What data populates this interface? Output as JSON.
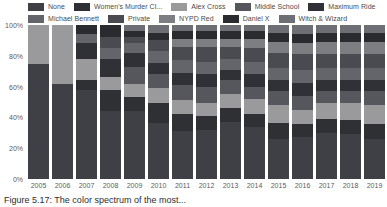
{
  "chart_data": {
    "type": "bar",
    "stacked": true,
    "normalized": true,
    "title": "",
    "subtitle": "",
    "xlabel": "",
    "ylabel": "",
    "ylim": [
      0,
      100
    ],
    "yticks": [
      "0%",
      "20%",
      "40%",
      "60%",
      "80%",
      "100%"
    ],
    "ytick_values": [
      0,
      20,
      40,
      60,
      80,
      100
    ],
    "grid": false,
    "legend_position": "top",
    "categories": [
      "2005",
      "2006",
      "2007",
      "2008",
      "2009",
      "2010",
      "2011",
      "2012",
      "2013",
      "2014",
      "2015",
      "2016",
      "2017",
      "2018",
      "2019"
    ],
    "series": [
      {
        "name": "None",
        "color": "#3f4045",
        "values": [
          75,
          62,
          58,
          44,
          44,
          36,
          31,
          32,
          37,
          34,
          26,
          27,
          30,
          29,
          26
        ]
      },
      {
        "name": "Women's Murder Cl...",
        "color": "#2f3034",
        "values": [
          0,
          0,
          6,
          14,
          9,
          13,
          11,
          9,
          9,
          8,
          10,
          9,
          9,
          9,
          10
        ]
      },
      {
        "name": "Alex Cross",
        "color": "#9a9a9c",
        "values": [
          25,
          38,
          14,
          8,
          9,
          10,
          9,
          8,
          9,
          10,
          12,
          9,
          10,
          11,
          12
        ]
      },
      {
        "name": "Middle School",
        "color": "#56575c",
        "values": [
          0,
          0,
          0,
          0,
          11,
          9,
          10,
          11,
          9,
          8,
          9,
          9,
          8,
          8,
          9
        ]
      },
      {
        "name": "Maximum Ride",
        "color": "#303136",
        "values": [
          0,
          0,
          10,
          12,
          9,
          7,
          8,
          8,
          7,
          8,
          7,
          8,
          7,
          7,
          7
        ]
      },
      {
        "name": "Michael Bennett",
        "color": "#64656a",
        "values": [
          0,
          0,
          6,
          7,
          6,
          8,
          8,
          8,
          7,
          8,
          8,
          9,
          8,
          8,
          8
        ]
      },
      {
        "name": "Private",
        "color": "#4a4b50",
        "values": [
          0,
          0,
          0,
          7,
          4,
          7,
          9,
          10,
          8,
          9,
          10,
          10,
          9,
          9,
          9
        ]
      },
      {
        "name": "NYPD Red",
        "color": "#7d7e82",
        "values": [
          0,
          0,
          0,
          0,
          0,
          0,
          5,
          5,
          5,
          6,
          7,
          7,
          8,
          8,
          8
        ]
      },
      {
        "name": "Daniel X",
        "color": "#2a2b2f",
        "values": [
          0,
          0,
          6,
          8,
          4,
          5,
          5,
          5,
          5,
          5,
          6,
          6,
          6,
          6,
          6
        ]
      },
      {
        "name": "Witch & Wizard",
        "color": "#6e6f74",
        "values": [
          0,
          0,
          0,
          0,
          4,
          5,
          4,
          4,
          4,
          4,
          5,
          6,
          5,
          5,
          5
        ]
      }
    ]
  },
  "legend": {
    "rows": [
      [
        {
          "label": "None",
          "color": "#3f4045"
        },
        {
          "label": "Women's Murder Cl...",
          "color": "#2f3034"
        },
        {
          "label": "Alex Cross",
          "color": "#9a9a9c"
        },
        {
          "label": "Middle School",
          "color": "#56575c"
        },
        {
          "label": "Maximum Ride",
          "color": "#303136"
        }
      ],
      [
        {
          "label": "Michael Bennett",
          "color": "#64656a"
        },
        {
          "label": "Private",
          "color": "#4a4b50"
        },
        {
          "label": "NYPD Red",
          "color": "#7d7e82"
        },
        {
          "label": "Daniel X",
          "color": "#2a2b2f"
        },
        {
          "label": "Witch & Wizard",
          "color": "#6e6f74"
        }
      ]
    ]
  },
  "caption": {
    "text": "Figure 5.17: The color spectrum of the most..."
  }
}
